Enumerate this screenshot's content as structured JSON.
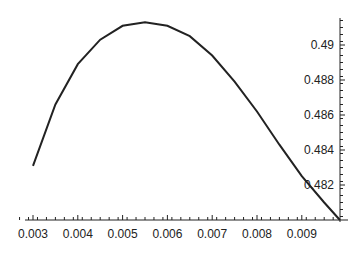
{
  "chart_data": {
    "type": "line",
    "title": "",
    "xlabel": "",
    "ylabel": "",
    "xlim": [
      0.0026,
      0.00985
    ],
    "ylim": [
      0.48,
      0.4916
    ],
    "xticks": [
      "0.003",
      "0.004",
      "0.005",
      "0.006",
      "0.007",
      "0.008",
      "0.009"
    ],
    "yticks": [
      "0.482",
      "0.484",
      "0.486",
      "0.488",
      "0.49"
    ],
    "series": [
      {
        "name": "curve",
        "x": [
          0.003,
          0.0035,
          0.004,
          0.0045,
          0.005,
          0.0055,
          0.006,
          0.0065,
          0.007,
          0.0075,
          0.008,
          0.0085,
          0.009,
          0.0095,
          0.00985
        ],
        "y": [
          0.4831,
          0.4866,
          0.4889,
          0.4903,
          0.4911,
          0.4913,
          0.4911,
          0.4905,
          0.4894,
          0.4879,
          0.4862,
          0.4843,
          0.4825,
          0.481,
          0.48
        ]
      }
    ],
    "grid": false,
    "legend": "none"
  }
}
